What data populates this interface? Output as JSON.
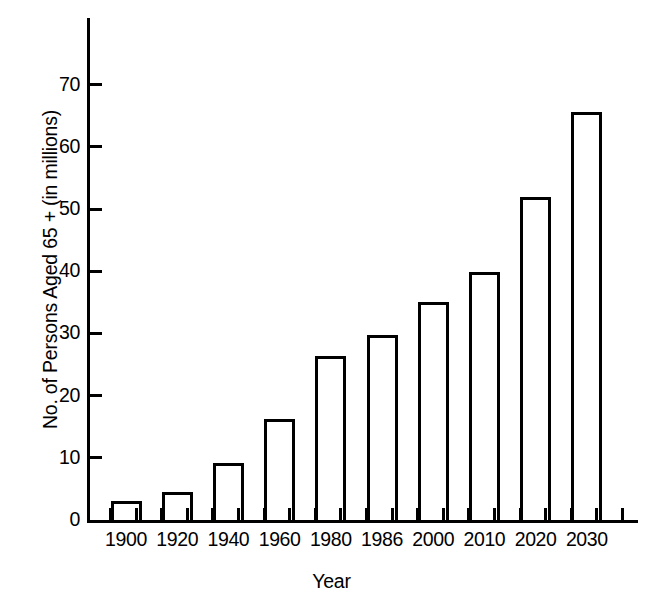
{
  "chart_data": {
    "type": "bar",
    "title": "",
    "xlabel": "Year",
    "ylabel": "No. of Persons Aged 65 + (in millions)",
    "categories": [
      "1900",
      "1920",
      "1940",
      "1960",
      "1980",
      "1986",
      "2000",
      "2010",
      "2020",
      "2030"
    ],
    "values": [
      3.1,
      4.5,
      9.2,
      16.3,
      26.3,
      29.8,
      35.0,
      39.9,
      51.9,
      65.6
    ],
    "ylim": [
      0,
      76
    ],
    "yticks": [
      0,
      10,
      20,
      30,
      40,
      50,
      60,
      70
    ],
    "ytick_labels": [
      "0",
      "10",
      "20",
      "30",
      "40",
      "50",
      "60",
      "70"
    ],
    "grid": false,
    "legend": null,
    "bar_style": {
      "fill": "#ffffff",
      "edge_color": "#000000",
      "edge_width": 3
    }
  },
  "axes": {
    "y_title": "No. of Persons Aged 65 + (in millions)",
    "x_title": "Year"
  }
}
